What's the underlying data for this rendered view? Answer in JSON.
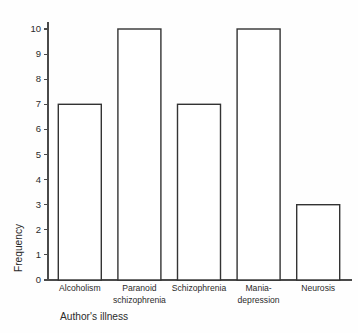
{
  "chart_data": {
    "type": "bar",
    "title": "",
    "xlabel": "Author's illness",
    "ylabel": "Frequency",
    "categories": [
      "Alcoholism",
      "Paranoid schizophrenia",
      "Schizophrenia",
      "Mania-depression",
      "Neurosis"
    ],
    "category_lines": [
      [
        "Alcoholism"
      ],
      [
        "Paranoid",
        "schizophrenia"
      ],
      [
        "Schizophrenia"
      ],
      [
        "Mania-",
        "depression"
      ],
      [
        "Neurosis"
      ]
    ],
    "values": [
      7,
      10,
      7,
      10,
      3
    ],
    "ylim": [
      0,
      10
    ],
    "ytick_labels": [
      "0",
      "1",
      "2",
      "3",
      "4",
      "5",
      "6",
      "7",
      "8",
      "9",
      "10"
    ],
    "ytick_values": [
      0,
      1,
      2,
      3,
      4,
      5,
      6,
      7,
      8,
      9,
      10
    ],
    "grid": false,
    "legend": false,
    "legend_position": "none",
    "bar_fill_color": "#ffffff",
    "bar_edge_color": "#333333",
    "axis_color": "#4a4a4a",
    "background_color": "#fefefe"
  }
}
